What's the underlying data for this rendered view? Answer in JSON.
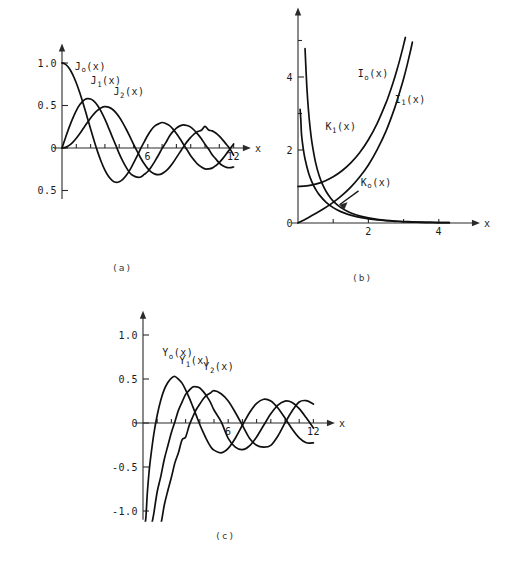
{
  "figure": {
    "background_color": "#ffffff",
    "ink_color": "#101010"
  },
  "panels": [
    {
      "id": "a",
      "caption": "(a)",
      "xaxis_name": "x",
      "yticklabels": [
        "1.0",
        "0.5",
        "0",
        "0.5"
      ],
      "xticklabels": [
        "6",
        "12"
      ],
      "curve_labels": [
        "J",
        "J",
        "J"
      ],
      "curve_label_subs": [
        "o",
        "1",
        "2"
      ],
      "curve_label_args": [
        "(x)",
        "(x)",
        "(x)"
      ]
    },
    {
      "id": "b",
      "caption": "(b)",
      "xaxis_name": "x",
      "yticklabels": [
        "4",
        "2",
        "0"
      ],
      "xticklabels": [
        "2",
        "4"
      ],
      "curve_labels": [
        "I",
        "I",
        "K",
        "K"
      ],
      "curve_label_subs": [
        "o",
        "1",
        "1",
        "o"
      ],
      "curve_label_args": [
        "(x)",
        "(x)",
        "(x)",
        "(x)"
      ]
    },
    {
      "id": "c",
      "caption": "(c)",
      "xaxis_name": "x",
      "yticklabels": [
        "1.0",
        "0.5",
        "0",
        "-0.5",
        "-1.0"
      ],
      "xticklabels": [
        "6",
        "12"
      ],
      "curve_labels": [
        "Y",
        "Y",
        "Y"
      ],
      "curve_label_subs": [
        "o",
        "1",
        "2"
      ],
      "curve_label_args": [
        "(x)",
        "(x)",
        "(x)"
      ]
    }
  ],
  "chart_data": [
    {
      "type": "line",
      "panel": "a",
      "title": "",
      "xlabel": "x",
      "ylabel": "",
      "xlim": [
        0,
        12.3
      ],
      "ylim": [
        -0.6,
        1.1
      ],
      "xticks": [
        1,
        2,
        3,
        4,
        5,
        6,
        7,
        8,
        9,
        10,
        11,
        12
      ],
      "xtick_labels": {
        "6": "6",
        "12": "12"
      },
      "yticks": [
        -0.5,
        0,
        0.5,
        1.0
      ],
      "ytick_labels": {
        "1.0": "1.0",
        "0.5": "0.5",
        "0": "0",
        "-0.5": "0.5"
      },
      "grid": false,
      "legend": "inline-annotations",
      "series": [
        {
          "name": "J_o(x)",
          "label": "J",
          "sub": "o",
          "arg": "(x)",
          "label_x": 0.9,
          "label_y": 0.92,
          "x": [
            0,
            0.25,
            0.5,
            0.75,
            1,
            1.25,
            1.5,
            1.75,
            2,
            2.25,
            2.5,
            2.75,
            3,
            3.25,
            3.5,
            3.75,
            4,
            4.25,
            4.5,
            4.75,
            5,
            5.25,
            5.5,
            5.75,
            6,
            6.25,
            6.5,
            6.75,
            7,
            7.25,
            7.5,
            7.75,
            8,
            8.25,
            8.5,
            8.75,
            9,
            9.25,
            9.5,
            9.75,
            10,
            10.25,
            10.5,
            10.75,
            11,
            11.25,
            11.5,
            11.75,
            12
          ],
          "y": [
            1,
            0.9844,
            0.9385,
            0.8642,
            0.7652,
            0.6459,
            0.5118,
            0.369,
            0.2239,
            0.0827,
            -0.0484,
            -0.1641,
            -0.2601,
            -0.3332,
            -0.3801,
            -0.4026,
            -0.3971,
            -0.3686,
            -0.3205,
            -0.2566,
            -0.1776,
            -0.0968,
            -0.0068,
            0.0724,
            0.1506,
            0.2159,
            0.2601,
            0.2837,
            0.3001,
            0.2887,
            0.2663,
            0.2252,
            0.1717,
            0.1096,
            0.0419,
            -0.0238,
            -0.0903,
            -0.1452,
            -0.1939,
            -0.2244,
            -0.2459,
            -0.2453,
            -0.2366,
            -0.2083,
            -0.1712,
            -0.1222,
            -0.0677,
            -0.0104,
            0.0477
          ]
        },
        {
          "name": "J_1(x)",
          "label": "J",
          "sub": "1",
          "arg": "(x)",
          "label_x": 2.0,
          "label_y": 0.75,
          "x": [
            0,
            0.25,
            0.5,
            0.75,
            1,
            1.25,
            1.5,
            1.75,
            2,
            2.25,
            2.5,
            2.75,
            3,
            3.25,
            3.5,
            3.75,
            4,
            4.25,
            4.5,
            4.75,
            5,
            5.25,
            5.5,
            5.75,
            6,
            6.25,
            6.5,
            6.75,
            7,
            7.25,
            7.5,
            7.75,
            8,
            8.25,
            8.5,
            8.75,
            9,
            9.25,
            9.5,
            9.75,
            10,
            10.25,
            10.5,
            10.75,
            11,
            11.25,
            11.5,
            11.75,
            12
          ],
          "y": [
            0,
            0.124,
            0.2423,
            0.3492,
            0.4401,
            0.5106,
            0.5579,
            0.5802,
            0.5767,
            0.5484,
            0.4971,
            0.4256,
            0.3391,
            0.2403,
            0.1374,
            0.0366,
            -0.066,
            -0.1538,
            -0.2311,
            -0.2935,
            -0.3276,
            -0.343,
            -0.3414,
            -0.311,
            -0.2767,
            -0.2196,
            -0.1538,
            -0.0826,
            -0.0047,
            0.0605,
            0.1352,
            0.1921,
            0.2346,
            0.2604,
            0.2731,
            0.2641,
            0.2453,
            0.2091,
            0.1613,
            0.1083,
            0.0435,
            -0.0126,
            -0.0789,
            -0.1277,
            -0.1768,
            -0.2085,
            -0.2284,
            -0.232,
            -0.2234
          ]
        },
        {
          "name": "J_2(x)",
          "label": "J",
          "sub": "2",
          "arg": "(x)",
          "label_x": 3.6,
          "label_y": 0.62,
          "x": [
            0,
            0.25,
            0.5,
            0.75,
            1,
            1.25,
            1.5,
            1.75,
            2,
            2.25,
            2.5,
            2.75,
            3,
            3.25,
            3.5,
            3.75,
            4,
            4.25,
            4.5,
            4.75,
            5,
            5.25,
            5.5,
            5.75,
            6,
            6.25,
            6.5,
            6.75,
            7,
            7.25,
            7.5,
            7.75,
            8,
            8.25,
            8.5,
            8.75,
            9,
            9.25,
            9.5,
            9.75,
            10,
            10.25,
            10.5,
            10.75,
            11,
            11.25,
            11.5,
            11.75,
            12
          ],
          "y": [
            0,
            0.0078,
            0.0306,
            0.0671,
            0.1149,
            0.1711,
            0.2321,
            0.294,
            0.3528,
            0.4048,
            0.4461,
            0.4743,
            0.4861,
            0.4813,
            0.4586,
            0.4194,
            0.3641,
            0.2961,
            0.2178,
            0.1331,
            0.0466,
            -0.0375,
            -0.1173,
            -0.1864,
            -0.2429,
            -0.2838,
            -0.3074,
            -0.3132,
            -0.3014,
            -0.2731,
            -0.2303,
            -0.1762,
            -0.113,
            -0.0488,
            0.0163,
            0.075,
            0.1247,
            0.1671,
            0.1947,
            0.209,
            0.2546,
            0.2122,
            0.2017,
            0.1759,
            0.139,
            0.0928,
            0.0412,
            -0.0121,
            -0.0849
          ]
        }
      ]
    },
    {
      "type": "line",
      "panel": "b",
      "title": "",
      "xlabel": "x",
      "ylabel": "",
      "xlim": [
        0,
        4.8
      ],
      "ylim": [
        0,
        5.6
      ],
      "xticks": [
        1,
        2,
        3,
        4
      ],
      "xtick_labels": {
        "2": "2",
        "4": "4"
      },
      "yticks": [
        1,
        2,
        3,
        4,
        5
      ],
      "ytick_labels": {
        "4": "4",
        "2": "2",
        "0": "0"
      },
      "grid": false,
      "legend": "inline-annotations",
      "annotation": {
        "text": "K_o(x) arrow points to K_o curve near x=1.1",
        "arrow": true
      },
      "series": [
        {
          "name": "I_o(x)",
          "label": "I",
          "sub": "o",
          "arg": "(x)",
          "label_x": 1.7,
          "label_y": 4.0,
          "x": [
            0,
            0.25,
            0.5,
            0.75,
            1,
            1.25,
            1.5,
            1.75,
            2,
            2.25,
            2.5,
            2.6,
            2.7,
            2.8,
            2.9,
            3.0,
            3.05
          ],
          "y": [
            1,
            1.0157,
            1.0635,
            1.1456,
            1.2661,
            1.4305,
            1.6467,
            1.9249,
            2.2796,
            2.7295,
            3.2898,
            3.5533,
            3.8417,
            4.1573,
            4.5027,
            4.8808,
            5.083
          ]
        },
        {
          "name": "I_1(x)",
          "label": "I",
          "sub": "1",
          "arg": "(x)",
          "label_x": 2.75,
          "label_y": 3.3,
          "x": [
            0,
            0.25,
            0.5,
            0.75,
            1,
            1.25,
            1.5,
            1.75,
            2,
            2.25,
            2.5,
            2.75,
            2.9,
            3.0,
            3.1,
            3.2,
            3.25
          ],
          "y": [
            0,
            0.126,
            0.2579,
            0.402,
            0.5652,
            0.755,
            0.9817,
            1.2582,
            1.5906,
            2.0101,
            2.5167,
            3.161,
            3.6259,
            3.9534,
            4.3262,
            4.7343,
            4.9565
          ]
        },
        {
          "name": "K_1(x)",
          "label": "K",
          "sub": "1",
          "arg": "(x)",
          "label_x": 0.78,
          "label_y": 2.55,
          "x": [
            0.2,
            0.25,
            0.3,
            0.35,
            0.4,
            0.5,
            0.6,
            0.7,
            0.8,
            0.9,
            1.0,
            1.2,
            1.4,
            1.6,
            1.8,
            2.0,
            2.25,
            2.5,
            2.75,
            3.0,
            3.25,
            3.5,
            3.75,
            4.0,
            4.3
          ],
          "y": [
            4.776,
            3.747,
            3.056,
            2.559,
            2.184,
            1.656,
            1.303,
            1.05,
            0.862,
            0.716,
            0.602,
            0.434,
            0.321,
            0.241,
            0.183,
            0.14,
            0.1008,
            0.0739,
            0.0546,
            0.0402,
            0.0301,
            0.0222,
            0.0167,
            0.0125,
            0.0085
          ]
        },
        {
          "name": "K_o(x)",
          "label": "K",
          "sub": "o",
          "arg": "(x)",
          "label_x": 1.78,
          "label_y": 1.02,
          "x": [
            0.06,
            0.08,
            0.1,
            0.15,
            0.2,
            0.3,
            0.4,
            0.5,
            0.6,
            0.8,
            1.0,
            1.2,
            1.4,
            1.6,
            1.8,
            2.0,
            2.25,
            2.5,
            2.75,
            3.0,
            3.25,
            3.5,
            3.75,
            4.0,
            4.3
          ],
          "y": [
            3.114,
            2.827,
            2.427,
            2.03,
            1.753,
            1.372,
            1.115,
            0.924,
            0.778,
            0.565,
            0.421,
            0.318,
            0.244,
            0.188,
            0.146,
            0.114,
            0.0837,
            0.0623,
            0.0465,
            0.0347,
            0.0261,
            0.0196,
            0.0148,
            0.0112,
            0.0078
          ]
        }
      ]
    },
    {
      "type": "line",
      "panel": "c",
      "title": "",
      "xlabel": "x",
      "ylabel": "",
      "xlim": [
        0,
        12.6
      ],
      "ylim": [
        -1.1,
        1.15
      ],
      "xticks": [
        1,
        2,
        3,
        4,
        5,
        6,
        7,
        8,
        9,
        10,
        11,
        12
      ],
      "xtick_labels": {
        "6": "6",
        "12": "12"
      },
      "yticks": [
        -1.0,
        -0.5,
        0,
        0.5,
        1.0
      ],
      "ytick_labels": {
        "1.0": "1.0",
        "0.5": "0.5",
        "0": "0",
        "-0.5": "-0.5",
        "-1.0": "-1.0"
      },
      "grid": false,
      "legend": "inline-annotations",
      "series": [
        {
          "name": "Y_o(x)",
          "label": "Y",
          "sub": "o",
          "arg": "(x)",
          "label_x": 1.35,
          "label_y": 0.76,
          "x": [
            0.12,
            0.2,
            0.3,
            0.4,
            0.5,
            0.75,
            1,
            1.25,
            1.5,
            1.75,
            2,
            2.25,
            2.5,
            2.75,
            3,
            3.25,
            3.5,
            3.75,
            4,
            4.25,
            4.5,
            4.75,
            5,
            5.5,
            6,
            6.5,
            7,
            7.5,
            8,
            8.5,
            9,
            9.5,
            10,
            10.5,
            11,
            11.5,
            12
          ],
          "y": [
            -1.85,
            -1.081,
            -0.807,
            -0.606,
            -0.445,
            -0.137,
            0.088,
            0.2582,
            0.3825,
            0.4605,
            0.5104,
            0.5285,
            0.4981,
            0.4529,
            0.3769,
            0.2882,
            0.189,
            0.0864,
            -0.0169,
            -0.1104,
            -0.1947,
            -0.2655,
            -0.3085,
            -0.3395,
            -0.2882,
            -0.1732,
            -0.0259,
            0.1173,
            0.2235,
            0.2702,
            0.2499,
            0.1712,
            0.0557,
            -0.0681,
            -0.1688,
            -0.2252,
            -0.2252
          ]
        },
        {
          "name": "Y_1(x)",
          "label": "Y",
          "sub": "1",
          "arg": "(x)",
          "label_x": 2.55,
          "label_y": 0.67,
          "x": [
            0.3,
            0.4,
            0.5,
            0.6,
            0.75,
            1,
            1.25,
            1.5,
            1.75,
            2,
            2.25,
            2.5,
            2.75,
            3,
            3.25,
            3.5,
            3.75,
            4,
            4.25,
            4.5,
            4.75,
            5,
            5.5,
            6,
            6.5,
            7,
            7.5,
            8,
            8.5,
            9,
            9.5,
            10,
            10.5,
            11,
            11.5,
            12
          ],
          "y": [
            -2.293,
            -1.781,
            -1.471,
            -1.26,
            -1.038,
            -0.781,
            -0.61,
            -0.412,
            -0.259,
            -0.107,
            0.0152,
            0.1459,
            0.2376,
            0.3247,
            0.3707,
            0.4102,
            0.4102,
            0.3979,
            0.3563,
            0.301,
            0.2353,
            0.1479,
            0.0149,
            -0.175,
            -0.2741,
            -0.3027,
            -0.2591,
            -0.1581,
            -0.0262,
            0.1043,
            0.2032,
            0.249,
            0.2337,
            0.1637,
            0.0591,
            -0.0571
          ]
        },
        {
          "name": "Y_2(x)",
          "label": "Y",
          "sub": "2",
          "arg": "(x)",
          "label_x": 4.25,
          "label_y": 0.6,
          "x": [
            0.65,
            0.8,
            1,
            1.25,
            1.5,
            1.75,
            2,
            2.25,
            2.5,
            2.75,
            3,
            3.25,
            3.5,
            3.75,
            4,
            4.25,
            4.5,
            4.75,
            5,
            5.5,
            6,
            6.5,
            7,
            7.5,
            8,
            8.5,
            9,
            9.5,
            10,
            10.5,
            11,
            11.5,
            12
          ],
          "y": [
            -2.21,
            -1.633,
            -1.65,
            -1.193,
            -0.932,
            -0.767,
            -0.6174,
            -0.4505,
            -0.3347,
            -0.192,
            -0.1604,
            -0.03,
            0.0679,
            0.1532,
            0.2159,
            0.2748,
            0.318,
            0.3416,
            0.3677,
            0.3321,
            0.2499,
            0.1198,
            -0.0259,
            -0.1726,
            -0.2536,
            -0.2735,
            -0.2536,
            -0.1472,
            0.001,
            0.1368,
            0.2393,
            0.2537,
            0.215
          ]
        }
      ]
    }
  ]
}
